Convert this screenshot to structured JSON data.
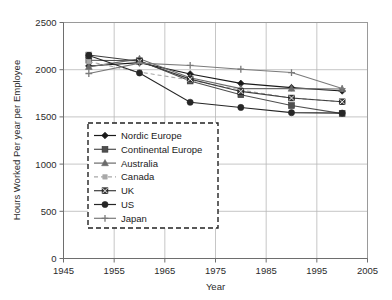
{
  "chart_data": {
    "type": "line",
    "title": "",
    "xlabel": "Year",
    "ylabel": "Hours Worked Per year per Employee",
    "xlim": [
      1945,
      2005
    ],
    "ylim": [
      0,
      2500
    ],
    "xticks": [
      1945,
      1955,
      1965,
      1975,
      1985,
      1995,
      2005
    ],
    "yticks": [
      0,
      500,
      1000,
      1500,
      2000,
      2500
    ],
    "grid": true,
    "legend_position": "inside-lower-left",
    "x": [
      1950,
      1960,
      1970,
      1980,
      1990,
      2000
    ],
    "series": [
      {
        "name": "Nordic Europe",
        "marker": "diamond",
        "color": "#1a1a1a",
        "dash": "none",
        "values": [
          2040,
          2075,
          1955,
          1855,
          1810,
          1775
        ]
      },
      {
        "name": "Continental Europe",
        "marker": "square",
        "color": "#4f4f4f",
        "dash": "none",
        "values": [
          2100,
          2095,
          1880,
          1735,
          1620,
          1535
        ]
      },
      {
        "name": "Australia",
        "marker": "triangle",
        "color": "#6b6b6b",
        "dash": "none",
        "values": [
          2030,
          2115,
          1915,
          1800,
          1800,
          1795
        ]
      },
      {
        "name": "Canada",
        "marker": "small-square",
        "color": "#a8a8a8",
        "dash": "dashed",
        "values": [
          2085,
          1975,
          1890,
          1785,
          1700,
          1660
        ]
      },
      {
        "name": "UK",
        "marker": "x-square",
        "color": "#3d3d3d",
        "dash": "none",
        "values": [
          2155,
          2090,
          1900,
          1770,
          1700,
          1660
        ]
      },
      {
        "name": "US",
        "marker": "circle",
        "color": "#262626",
        "dash": "none",
        "values": [
          2150,
          1965,
          1655,
          1600,
          1545,
          1540
        ]
      },
      {
        "name": "Japan",
        "marker": "plus",
        "color": "#7a7a7a",
        "dash": "none",
        "values": [
          1960,
          2070,
          2045,
          2005,
          1970,
          1800
        ]
      }
    ]
  },
  "legend": {
    "items": [
      {
        "label": "Nordic Europe"
      },
      {
        "label": "Continental Europe"
      },
      {
        "label": "Australia"
      },
      {
        "label": "Canada"
      },
      {
        "label": "UK"
      },
      {
        "label": "US"
      },
      {
        "label": "Japan"
      }
    ]
  }
}
